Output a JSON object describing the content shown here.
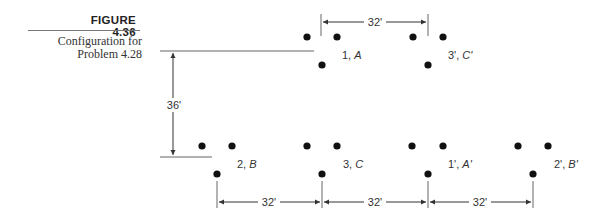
{
  "figure": {
    "number": "FIGURE 4.36",
    "caption_line1": "Configuration for",
    "caption_line2": "Problem 4.28"
  },
  "circuits": [
    {
      "id": "1A",
      "label_num": "1,",
      "label_phase": "A",
      "row": "top"
    },
    {
      "id": "3pCp",
      "label_num": "3',",
      "label_phase": "C'",
      "row": "top"
    },
    {
      "id": "2B",
      "label_num": "2,",
      "label_phase": "B",
      "row": "bottom"
    },
    {
      "id": "3C",
      "label_num": "3,",
      "label_phase": "C",
      "row": "bottom"
    },
    {
      "id": "1pAp",
      "label_num": "1',",
      "label_phase": "A'",
      "row": "bottom"
    },
    {
      "id": "2pBp",
      "label_num": "2',",
      "label_phase": "B'",
      "row": "bottom"
    }
  ],
  "dimensions": {
    "top_spacing": "32'",
    "vertical_spacing": "36'",
    "bottom_spacing_1": "32'",
    "bottom_spacing_2": "32'",
    "bottom_spacing_3": "32'"
  }
}
